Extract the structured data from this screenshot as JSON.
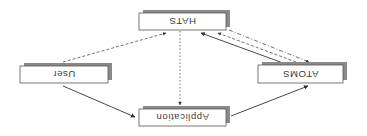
{
  "diagram": {
    "orientation": "rotated-180",
    "colors": {
      "box_fill": "#ffffff",
      "box_border": "#555555",
      "shadow": "#8a8a8a",
      "arrow": "#333333",
      "text": "#3a3a3a",
      "background": "#ffffff"
    },
    "nodes": [
      {
        "id": "hats",
        "label": "HATS",
        "x": 139,
        "y": 13,
        "w": 87,
        "h": 17
      },
      {
        "id": "user",
        "label": "User",
        "x": 20,
        "y": 66,
        "w": 88,
        "h": 17
      },
      {
        "id": "atoms",
        "label": "ATOMS",
        "x": 258,
        "y": 65,
        "w": 85,
        "h": 18
      },
      {
        "id": "application",
        "label": "Application",
        "x": 139,
        "y": 109,
        "w": 87,
        "h": 17
      }
    ],
    "edges": [
      {
        "from": "User",
        "to": "HATS",
        "style": "dashed",
        "x1": 63,
        "y1": 62,
        "x2": 166,
        "y2": 33
      },
      {
        "from": "User",
        "to": "Application",
        "style": "solid",
        "x1": 63,
        "y1": 86,
        "x2": 135,
        "y2": 117
      },
      {
        "from": "Application",
        "to": "ATOMS",
        "style": "solid",
        "x1": 231,
        "y1": 116,
        "x2": 308,
        "y2": 86
      },
      {
        "from": "HATS",
        "to": "Application",
        "style": "dotted",
        "x1": 180,
        "y1": 31,
        "x2": 180,
        "y2": 105
      },
      {
        "from": "ATOMS",
        "to": "HATS",
        "style": "solid",
        "x1": 283,
        "y1": 63,
        "x2": 201,
        "y2": 33
      },
      {
        "from": "ATOMS",
        "to": "HATS",
        "style": "dashed",
        "x1": 296,
        "y1": 62,
        "x2": 218,
        "y2": 33
      },
      {
        "from": "HATS",
        "to": "ATOMS",
        "style": "dashdot",
        "x1": 229,
        "y1": 30,
        "x2": 309,
        "y2": 62
      }
    ]
  }
}
